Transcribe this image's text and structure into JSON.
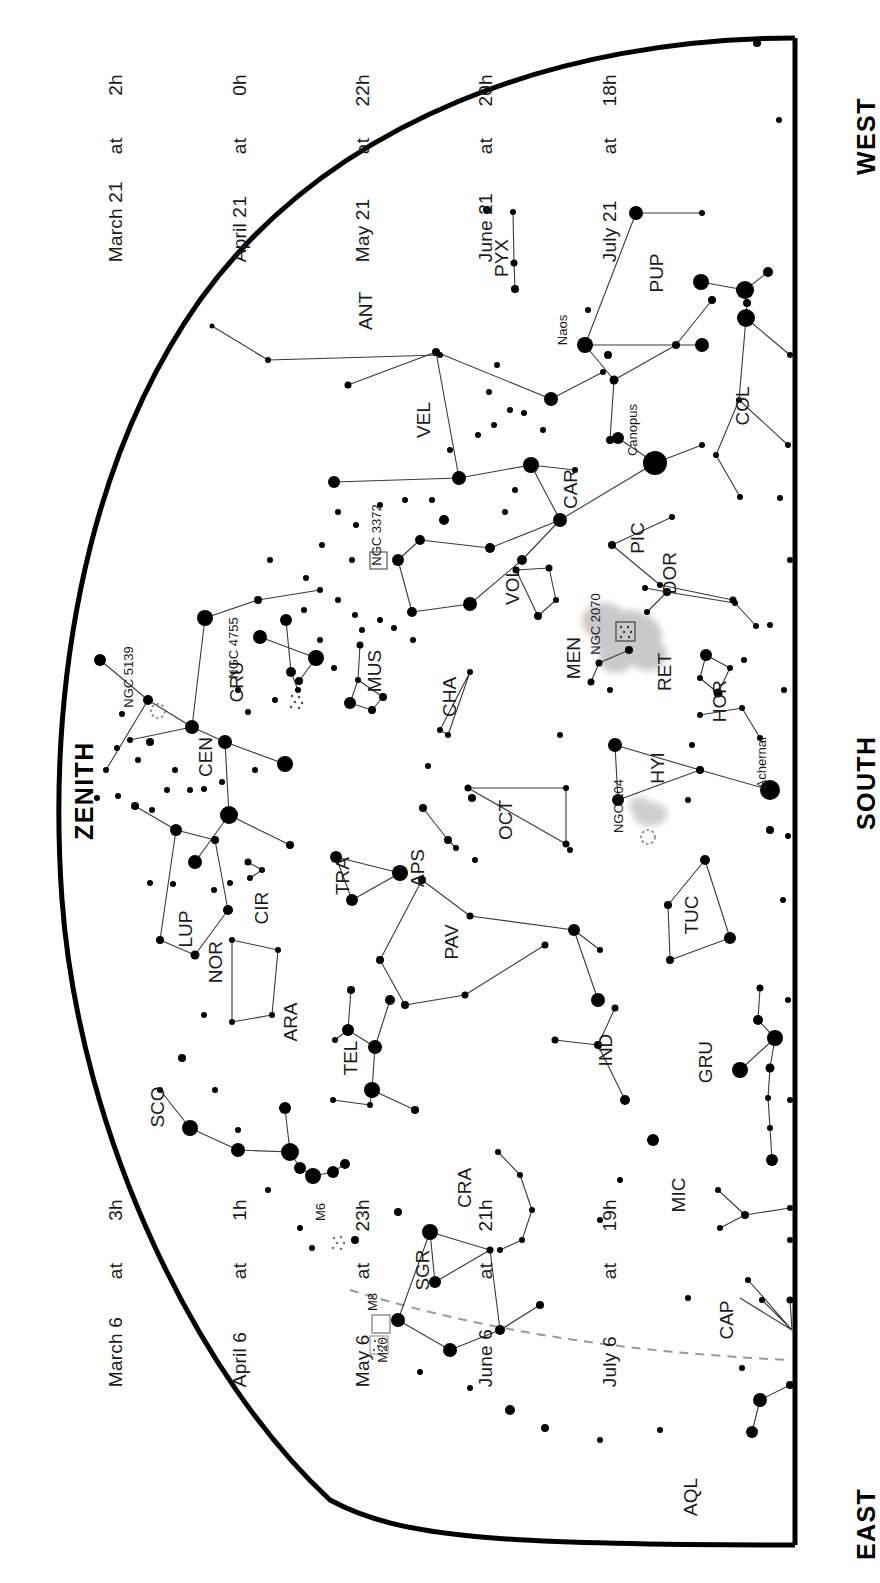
{
  "chart_data": {
    "type": "scatter",
    "orientation_note": "All text rendered rotated 90 degrees counter-clockwise",
    "grid": false,
    "legend": "none",
    "xlabel": "",
    "ylabel": "",
    "cardinals": [
      "WEST",
      "ZENITH",
      "SOUTH",
      "EAST"
    ],
    "epoch_tables": [
      {
        "id": "epoch-top",
        "rows": [
          {
            "date": "March 21",
            "at": "at",
            "time": "2h"
          },
          {
            "date": "April 21",
            "at": "at",
            "time": "0h"
          },
          {
            "date": "May 21",
            "at": "at",
            "time": "22h"
          },
          {
            "date": "June 21",
            "at": "at",
            "time": "20h"
          },
          {
            "date": "July 21",
            "at": "at",
            "time": "18h"
          }
        ]
      },
      {
        "id": "epoch-bottom",
        "rows": [
          {
            "date": "March 6",
            "at": "at",
            "time": "3h"
          },
          {
            "date": "April 6",
            "at": "at",
            "time": "1h"
          },
          {
            "date": "May 6",
            "at": "at",
            "time": "23h"
          },
          {
            "date": "June 6",
            "at": "at",
            "time": "21h"
          },
          {
            "date": "July 6",
            "at": "at",
            "time": "19h"
          }
        ]
      }
    ],
    "constellation_labels": [
      {
        "abbr": "PYX",
        "x": 508,
        "y": 258
      },
      {
        "abbr": "PUP",
        "x": 663,
        "y": 273
      },
      {
        "abbr": "ANT",
        "x": 372,
        "y": 311
      },
      {
        "abbr": "VEL",
        "x": 430,
        "y": 420
      },
      {
        "abbr": "COL",
        "x": 749,
        "y": 406
      },
      {
        "abbr": "CAR",
        "x": 577,
        "y": 489
      },
      {
        "abbr": "PIC",
        "x": 644,
        "y": 538
      },
      {
        "abbr": "NGC 3372",
        "x": 381,
        "y": 535
      },
      {
        "abbr": "DOR",
        "x": 676,
        "y": 573
      },
      {
        "abbr": "VOL",
        "x": 519,
        "y": 586
      },
      {
        "abbr": "NGC 2070",
        "x": 600,
        "y": 624
      },
      {
        "abbr": "NGC 4755",
        "x": 238,
        "y": 648
      },
      {
        "abbr": "NGC 5139",
        "x": 133,
        "y": 677
      },
      {
        "abbr": "MUS",
        "x": 381,
        "y": 671
      },
      {
        "abbr": "CRU",
        "x": 243,
        "y": 682
      },
      {
        "abbr": "MEN",
        "x": 580,
        "y": 658
      },
      {
        "abbr": "RET",
        "x": 671,
        "y": 672
      },
      {
        "abbr": "CHA",
        "x": 456,
        "y": 697
      },
      {
        "abbr": "HOR",
        "x": 726,
        "y": 701
      },
      {
        "abbr": "CEN",
        "x": 212,
        "y": 757
      },
      {
        "abbr": "HYI",
        "x": 664,
        "y": 768
      },
      {
        "abbr": "Achernar",
        "x": 766,
        "y": 762
      },
      {
        "abbr": "NGC 104",
        "x": 623,
        "y": 806
      },
      {
        "abbr": "OCT",
        "x": 512,
        "y": 820
      },
      {
        "abbr": "CIR",
        "x": 268,
        "y": 908
      },
      {
        "abbr": "TRA",
        "x": 349,
        "y": 876
      },
      {
        "abbr": "APS",
        "x": 424,
        "y": 868
      },
      {
        "abbr": "LUP",
        "x": 192,
        "y": 929
      },
      {
        "abbr": "NOR",
        "x": 222,
        "y": 962
      },
      {
        "abbr": "PAV",
        "x": 458,
        "y": 942
      },
      {
        "abbr": "TUC",
        "x": 698,
        "y": 915
      },
      {
        "abbr": "ARA",
        "x": 297,
        "y": 1022
      },
      {
        "abbr": "IND",
        "x": 612,
        "y": 1050
      },
      {
        "abbr": "TEL",
        "x": 357,
        "y": 1058
      },
      {
        "abbr": "SCO",
        "x": 164,
        "y": 1107
      },
      {
        "abbr": "GRU",
        "x": 712,
        "y": 1062
      },
      {
        "abbr": "CRA",
        "x": 471,
        "y": 1188
      },
      {
        "abbr": "M6",
        "x": 325,
        "y": 1212
      },
      {
        "abbr": "MIC",
        "x": 685,
        "y": 1195
      },
      {
        "abbr": "SGR",
        "x": 429,
        "y": 1270
      },
      {
        "abbr": "M8",
        "x": 377,
        "y": 1302
      },
      {
        "abbr": "M20",
        "x": 387,
        "y": 1350
      },
      {
        "abbr": "CAP",
        "x": 733,
        "y": 1320
      },
      {
        "abbr": "AQL",
        "x": 697,
        "y": 1497
      }
    ],
    "named_stars": [
      "Naos",
      "Canopus",
      "Achernar"
    ],
    "deep_sky_objects": [
      {
        "name": "NGC 3372",
        "kind": "nebula"
      },
      {
        "name": "NGC 2070",
        "kind": "nebula"
      },
      {
        "name": "NGC 4755",
        "kind": "open-cluster"
      },
      {
        "name": "NGC 5139",
        "kind": "globular-cluster"
      },
      {
        "name": "NGC 104",
        "kind": "globular-cluster"
      },
      {
        "name": "M6",
        "kind": "open-cluster"
      },
      {
        "name": "M8",
        "kind": "nebula"
      },
      {
        "name": "M20",
        "kind": "open-cluster"
      }
    ],
    "galaxies": [
      {
        "name": "Large Magellanic Cloud",
        "x": 625,
        "y": 637
      },
      {
        "name": "Small Magellanic Cloud",
        "x": 650,
        "y": 815
      }
    ],
    "ecliptic": "dashed grey arc across lower-left quadrant",
    "colors": {
      "background": "#ffffff",
      "star": "#000000",
      "horizon": "#000000",
      "constellation_line": "#3a3a3a",
      "magellanic_cloud": "#c8c8c8",
      "ecliptic": "#9a9a9a",
      "text": "#1a1a1a"
    }
  },
  "cardinals": {
    "west": "WEST",
    "zenith": "ZENITH",
    "south": "SOUTH",
    "east": "EAST"
  },
  "epoch_top": {
    "rows": [
      {
        "date": "March 21",
        "at": "at",
        "time": "2h"
      },
      {
        "date": "April 21",
        "at": "at",
        "time": "0h"
      },
      {
        "date": "May 21",
        "at": "at",
        "time": "22h"
      },
      {
        "date": "June 21",
        "at": "at",
        "time": "20h"
      },
      {
        "date": "July 21",
        "at": "at",
        "time": "18h"
      }
    ]
  },
  "epoch_bottom": {
    "rows": [
      {
        "date": "March 6",
        "at": "at",
        "time": "3h"
      },
      {
        "date": "April 6",
        "at": "at",
        "time": "1h"
      },
      {
        "date": "May 6",
        "at": "at",
        "time": "23h"
      },
      {
        "date": "June 6",
        "at": "at",
        "time": "21h"
      },
      {
        "date": "July 6",
        "at": "at",
        "time": "19h"
      }
    ]
  }
}
